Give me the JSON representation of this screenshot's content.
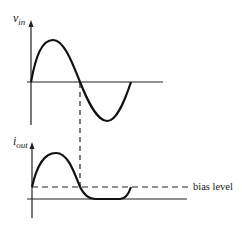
{
  "diagram": {
    "top_plot": {
      "ylabel": "v",
      "ylabel_sub": "in",
      "signal": "sine"
    },
    "bottom_plot": {
      "ylabel": "i",
      "ylabel_sub": "out",
      "signal": "clipped sine above bias",
      "bias_label": "bias level"
    },
    "colors": {
      "line": "#111111",
      "background": "#ffffff"
    }
  }
}
